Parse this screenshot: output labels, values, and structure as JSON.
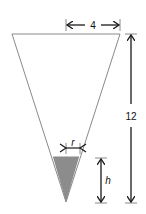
{
  "diagram": {
    "colors": {
      "outline": "#8a8a8a",
      "water": "#8c8c8c",
      "arrow": "#1a1a1a",
      "background": "#ffffff"
    },
    "labels": {
      "top_radius": "4",
      "height": "12",
      "water_radius": "r",
      "water_height": "h"
    },
    "cone": {
      "top_left": [
        12,
        34
      ],
      "top_right": [
        120,
        34
      ],
      "apex": [
        66,
        202
      ]
    },
    "water": {
      "surface_y": 157,
      "left": [
        53,
        157
      ],
      "right": [
        79,
        157
      ],
      "apex": [
        66,
        202
      ]
    }
  }
}
